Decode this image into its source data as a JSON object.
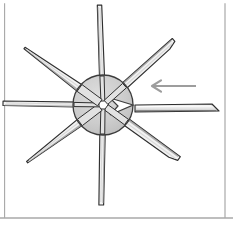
{
  "figure": {
    "title": "Impeller blade insertion diagram",
    "description": "Exploded technical illustration of a radial impeller wheel: a circular gray hub with a central bore and seven thin radial blades attached, one blade slot empty, and a detached blade at the right being pushed into place as indicated by a left-pointing arrow.",
    "background_color": "#ffffff",
    "border_color": "#8a8a8a",
    "border_color_top": "#6f6f6f"
  },
  "frame": {
    "name": "figure-border",
    "top_y": 3,
    "bottom_y": 218,
    "left_x": 4,
    "right_x": 225
  },
  "hub": {
    "label": "impeller-hub",
    "center_x": 103,
    "center_y": 105,
    "radius": 30,
    "fill_color": "#cfcfcf",
    "stroke_color": "#3c3c3c",
    "bore": {
      "label": "center-bore-hole",
      "center_x": 103,
      "center_y": 105,
      "radius": 5.5,
      "fill_color": "#ffffff",
      "stroke_color": "#3c3c3c"
    },
    "notch": {
      "label": "empty-blade-slot",
      "description": "V-shaped wedge notch cut into the right edge of the hub where the missing blade seats",
      "angle_deg": 0
    }
  },
  "blades": {
    "count_attached": 7,
    "count_detached": 1,
    "fill_color_light": "#f2f2f2",
    "fill_color_mid": "#d6d6d6",
    "fill_color_shadow": "#9a9a9a",
    "stroke_color": "#2f2f2f",
    "attached": [
      {
        "name": "blade-north",
        "angle_deg": 268,
        "length": 100,
        "half_width": 2.6,
        "tip": "flat"
      },
      {
        "name": "blade-northeast",
        "angle_deg": 318,
        "length": 96,
        "half_width": 3.6,
        "tip": "angled"
      },
      {
        "name": "blade-southeast",
        "angle_deg": 36,
        "length": 93,
        "half_width": 4.2,
        "tip": "angled"
      },
      {
        "name": "blade-south",
        "angle_deg": 91,
        "length": 100,
        "half_width": 2.8,
        "tip": "flat"
      },
      {
        "name": "blade-southwest",
        "angle_deg": 143,
        "length": 95,
        "half_width": 5.0,
        "tip": "pointed"
      },
      {
        "name": "blade-west",
        "angle_deg": 181,
        "length": 100,
        "half_width": 2.6,
        "tip": "flat"
      },
      {
        "name": "blade-northwest",
        "angle_deg": 216,
        "length": 97,
        "half_width": 5.2,
        "tip": "pointed"
      }
    ],
    "detached": {
      "name": "detached-blade",
      "start_x": 135,
      "end_x": 219,
      "center_y": 108,
      "half_width": 4.0,
      "orientation": "horizontal"
    }
  },
  "arrow": {
    "name": "insertion-direction-arrow",
    "direction": "left",
    "color": "#9d9d9d",
    "tail_x": 196,
    "tip_x": 152,
    "y": 86,
    "head_size": 9,
    "stroke_width": 2.2
  }
}
